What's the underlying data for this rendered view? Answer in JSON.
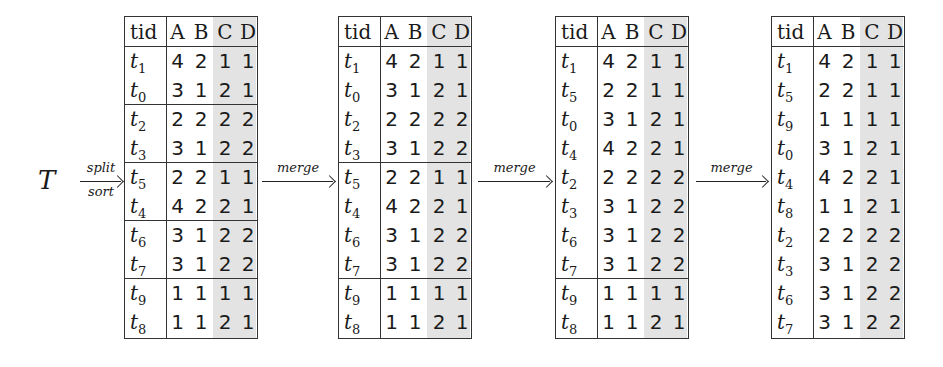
{
  "figure": {
    "input_symbol": "T",
    "columns": [
      "tid",
      "A",
      "B",
      "C",
      "D"
    ],
    "shaded_columns": [
      "C",
      "D"
    ],
    "arrows": [
      {
        "top": "split",
        "bottom": "sort"
      },
      {
        "top": "merge",
        "bottom": ""
      },
      {
        "top": "merge",
        "bottom": ""
      },
      {
        "top": "merge",
        "bottom": ""
      }
    ],
    "tables": [
      {
        "name": "after-split-sort",
        "groups": [
          [
            [
              "t",
              "1",
              "4",
              "2",
              "1",
              "1"
            ],
            [
              "t",
              "0",
              "3",
              "1",
              "2",
              "1"
            ]
          ],
          [
            [
              "t",
              "2",
              "2",
              "2",
              "2",
              "2"
            ],
            [
              "t",
              "3",
              "3",
              "1",
              "2",
              "2"
            ]
          ],
          [
            [
              "t",
              "5",
              "2",
              "2",
              "1",
              "1"
            ],
            [
              "t",
              "4",
              "4",
              "2",
              "2",
              "1"
            ]
          ],
          [
            [
              "t",
              "6",
              "3",
              "1",
              "2",
              "2"
            ],
            [
              "t",
              "7",
              "3",
              "1",
              "2",
              "2"
            ]
          ],
          [
            [
              "t",
              "9",
              "1",
              "1",
              "1",
              "1"
            ],
            [
              "t",
              "8",
              "1",
              "1",
              "2",
              "1"
            ]
          ]
        ]
      },
      {
        "name": "after-merge-1",
        "groups": [
          [
            [
              "t",
              "1",
              "4",
              "2",
              "1",
              "1"
            ],
            [
              "t",
              "0",
              "3",
              "1",
              "2",
              "1"
            ],
            [
              "t",
              "2",
              "2",
              "2",
              "2",
              "2"
            ],
            [
              "t",
              "3",
              "3",
              "1",
              "2",
              "2"
            ]
          ],
          [
            [
              "t",
              "5",
              "2",
              "2",
              "1",
              "1"
            ],
            [
              "t",
              "4",
              "4",
              "2",
              "2",
              "1"
            ],
            [
              "t",
              "6",
              "3",
              "1",
              "2",
              "2"
            ],
            [
              "t",
              "7",
              "3",
              "1",
              "2",
              "2"
            ]
          ],
          [
            [
              "t",
              "9",
              "1",
              "1",
              "1",
              "1"
            ],
            [
              "t",
              "8",
              "1",
              "1",
              "2",
              "1"
            ]
          ]
        ]
      },
      {
        "name": "after-merge-2",
        "groups": [
          [
            [
              "t",
              "1",
              "4",
              "2",
              "1",
              "1"
            ],
            [
              "t",
              "5",
              "2",
              "2",
              "1",
              "1"
            ],
            [
              "t",
              "0",
              "3",
              "1",
              "2",
              "1"
            ],
            [
              "t",
              "4",
              "4",
              "2",
              "2",
              "1"
            ],
            [
              "t",
              "2",
              "2",
              "2",
              "2",
              "2"
            ],
            [
              "t",
              "3",
              "3",
              "1",
              "2",
              "2"
            ],
            [
              "t",
              "6",
              "3",
              "1",
              "2",
              "2"
            ],
            [
              "t",
              "7",
              "3",
              "1",
              "2",
              "2"
            ]
          ],
          [
            [
              "t",
              "9",
              "1",
              "1",
              "1",
              "1"
            ],
            [
              "t",
              "8",
              "1",
              "1",
              "2",
              "1"
            ]
          ]
        ]
      },
      {
        "name": "after-merge-3",
        "groups": [
          [
            [
              "t",
              "1",
              "4",
              "2",
              "1",
              "1"
            ],
            [
              "t",
              "5",
              "2",
              "2",
              "1",
              "1"
            ],
            [
              "t",
              "9",
              "1",
              "1",
              "1",
              "1"
            ],
            [
              "t",
              "0",
              "3",
              "1",
              "2",
              "1"
            ],
            [
              "t",
              "4",
              "4",
              "2",
              "2",
              "1"
            ],
            [
              "t",
              "8",
              "1",
              "1",
              "2",
              "1"
            ],
            [
              "t",
              "2",
              "2",
              "2",
              "2",
              "2"
            ],
            [
              "t",
              "3",
              "3",
              "1",
              "2",
              "2"
            ],
            [
              "t",
              "6",
              "3",
              "1",
              "2",
              "2"
            ],
            [
              "t",
              "7",
              "3",
              "1",
              "2",
              "2"
            ]
          ]
        ]
      }
    ]
  },
  "layout": {
    "table_lefts": [
      124,
      338,
      555,
      771
    ],
    "arrow_spans": [
      [
        80,
        122
      ],
      [
        262,
        334
      ],
      [
        478,
        551
      ],
      [
        696,
        767
      ]
    ]
  }
}
